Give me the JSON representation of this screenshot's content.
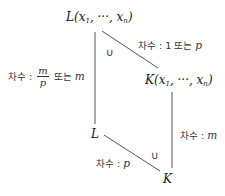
{
  "nodes": {
    "top": {
      "base": "L(x",
      "sub1": "1",
      "mid": ", ···, x",
      "subn": "n",
      "end": ")"
    },
    "right": {
      "base": "K(x",
      "sub1": "1",
      "mid": ", ···, x",
      "subn": "n",
      "end": ")"
    },
    "mid_left": {
      "text": "L"
    },
    "bottom": {
      "text": "K"
    }
  },
  "edges": {
    "top_right": {
      "prefix": "차수 : 1 또는 ",
      "var": "p"
    },
    "top_left": {
      "prefix": "차수 : ",
      "frac_num": "m",
      "frac_den": "p",
      "middle": " 또는 ",
      "var": "m"
    },
    "right_bottom": {
      "prefix": "차수 : ",
      "var": "m"
    },
    "left_bottom": {
      "prefix": "차수 : ",
      "var": "p"
    }
  },
  "subset_symbols": {
    "upper": "∪",
    "lower": "∪"
  },
  "colors": {
    "line": "#555555",
    "text": "#222222"
  }
}
